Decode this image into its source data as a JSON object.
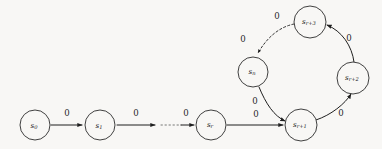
{
  "figure": {
    "type": "state-transition-diagram",
    "background_color": "#f8f7f5",
    "stroke_color": "#1f1f1f",
    "width": 382,
    "height": 149
  },
  "nodes": [
    {
      "id": "s0",
      "base": "s",
      "subscript": "0",
      "label": "s0",
      "cx": 35,
      "cy": 125,
      "r": 15
    },
    {
      "id": "s1",
      "base": "s",
      "subscript": "1",
      "label": "s1",
      "cx": 100,
      "cy": 125,
      "r": 15
    },
    {
      "id": "sr",
      "base": "s",
      "subscript": "r",
      "label": "sr",
      "cx": 211,
      "cy": 125,
      "r": 15
    },
    {
      "id": "sr1",
      "base": "s",
      "subscript": "r+1",
      "label": "sr+1",
      "cx": 301,
      "cy": 125,
      "r": 16
    },
    {
      "id": "sr2",
      "base": "s",
      "subscript": "r+2",
      "label": "sr+2",
      "cx": 353,
      "cy": 78,
      "r": 16
    },
    {
      "id": "sr3",
      "base": "s",
      "subscript": "r+3",
      "label": "sr+3",
      "cx": 310,
      "cy": 22,
      "r": 16
    },
    {
      "id": "sn",
      "base": "s",
      "subscript": "n",
      "label": "sn",
      "cx": 253,
      "cy": 72,
      "r": 15
    }
  ],
  "edges": [
    {
      "id": "e-s0-s1",
      "from": "s0",
      "to": "s1",
      "label": "0",
      "style": "solid",
      "label_x": 67,
      "label_y": 113
    },
    {
      "id": "e-s1-dots",
      "from": "s1",
      "to": "dots",
      "label": "0",
      "style": "solid",
      "label_x": 136,
      "label_y": 113
    },
    {
      "id": "e-dots-sr",
      "from": "dots",
      "to": "sr",
      "label": "0",
      "style": "solid",
      "label_x": 186,
      "label_y": 113
    },
    {
      "id": "e-sr-sr1",
      "from": "sr",
      "to": "sr1",
      "label": "0",
      "style": "solid",
      "label_x": 256,
      "label_y": 114
    },
    {
      "id": "e-sn-sr1",
      "from": "sn",
      "to": "sr1",
      "label": "0",
      "style": "solid",
      "label_x": 255,
      "label_y": 101
    },
    {
      "id": "e-sr1-sr2",
      "from": "sr1",
      "to": "sr2",
      "label": "0",
      "style": "solid",
      "label_x": 341,
      "label_y": 113
    },
    {
      "id": "e-sr2-sr3",
      "from": "sr2",
      "to": "sr3",
      "label": "0",
      "style": "solid",
      "label_x": 349,
      "label_y": 38
    },
    {
      "id": "e-sr3-sn-a",
      "from": "sr3",
      "to": "sn",
      "label": "0",
      "style": "dashed",
      "label_x": 277,
      "label_y": 16
    },
    {
      "id": "e-sr3-sn-b",
      "from": "sr3",
      "to": "sn",
      "label": "0",
      "style": "dashed",
      "label_x": 243,
      "label_y": 39
    }
  ],
  "ellipsis": {
    "id": "chain-ellipsis",
    "note": "dotted segment between s1 and sr indicating omitted states",
    "x1": 160,
    "x2": 180,
    "y": 125
  },
  "alphabet_symbol": "0"
}
